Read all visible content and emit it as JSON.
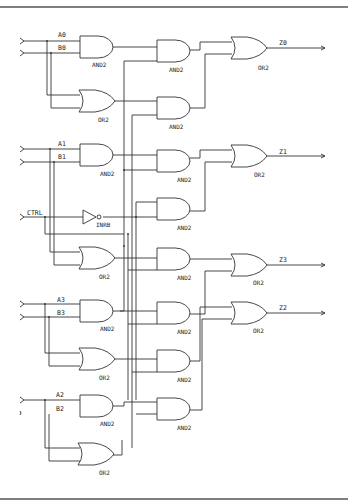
{
  "diagram": {
    "title": "",
    "inputs": [
      {
        "id": "A0",
        "label": "A0"
      },
      {
        "id": "B0",
        "label": "B0"
      },
      {
        "id": "A1",
        "label": "A1"
      },
      {
        "id": "B1",
        "label": "B1"
      },
      {
        "id": "CTRL",
        "label": "CTRL"
      },
      {
        "id": "A3",
        "label": "A3"
      },
      {
        "id": "B3",
        "label": "B3"
      },
      {
        "id": "A2",
        "label": "A2"
      },
      {
        "id": "B2",
        "label": "B2"
      }
    ],
    "outputs": [
      {
        "id": "Z0",
        "label": "Z0"
      },
      {
        "id": "Z1",
        "label": "Z1"
      },
      {
        "id": "Z3",
        "label": "Z3"
      },
      {
        "id": "Z2",
        "label": "Z2"
      }
    ],
    "gate_types": {
      "and": "AND2",
      "or": "OR2",
      "inv": "INRB"
    },
    "pins": {
      "a": "A",
      "b": "B",
      "y": "Z"
    },
    "col1_gates": [
      {
        "type": "AND2",
        "inputs": [
          "A0",
          "B0"
        ]
      },
      {
        "type": "OR2",
        "inputs": [
          "A0",
          "B0"
        ]
      },
      {
        "type": "AND2",
        "inputs": [
          "A1",
          "B1"
        ]
      },
      {
        "type": "INRB",
        "inputs": [
          "CTRL"
        ]
      },
      {
        "type": "OR2",
        "inputs": [
          "A1",
          "B1"
        ]
      },
      {
        "type": "AND2",
        "inputs": [
          "A3",
          "B3"
        ]
      },
      {
        "type": "OR2",
        "inputs": [
          "A3",
          "B3"
        ]
      },
      {
        "type": "AND2",
        "inputs": [
          "A2",
          "B2"
        ]
      },
      {
        "type": "OR2",
        "inputs": [
          "A2",
          "B2"
        ]
      }
    ],
    "col2_gates": [
      {
        "type": "AND2"
      },
      {
        "type": "AND2"
      },
      {
        "type": "AND2"
      },
      {
        "type": "AND2"
      },
      {
        "type": "AND2"
      },
      {
        "type": "AND2"
      },
      {
        "type": "AND2"
      },
      {
        "type": "AND2"
      }
    ],
    "col3_gates": [
      {
        "type": "OR2",
        "output": "Z0"
      },
      {
        "type": "OR2",
        "output": "Z1"
      },
      {
        "type": "OR2",
        "output": "Z3"
      },
      {
        "type": "OR2",
        "output": "Z2"
      }
    ],
    "colors": {
      "line": "#333333",
      "background": "#ffffff",
      "border": "#555555"
    }
  }
}
